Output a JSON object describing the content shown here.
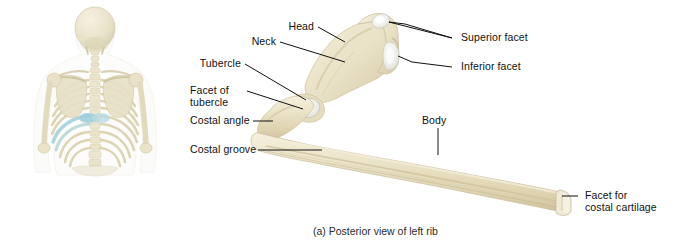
{
  "figure": {
    "caption": "(a) Posterior view of left rib",
    "orientation_panel": {
      "name": "posterior-torso-skeleton",
      "description": "Posterior view of upper torso skeleton with left rib highlighted",
      "highlight_color": "#a9d6e0",
      "bone_color": "#efe9d6"
    },
    "specimen": {
      "name": "left-rib",
      "bone_color": "#ece3c8",
      "bone_shadow": "#d9ccaa",
      "cartilage_color": "#f2f2ee"
    }
  },
  "labels": [
    {
      "id": "head",
      "text": "Head",
      "side": "left"
    },
    {
      "id": "neck",
      "text": "Neck",
      "side": "left"
    },
    {
      "id": "tubercle",
      "text": "Tubercle",
      "side": "left"
    },
    {
      "id": "facet-of-tubercle",
      "text": "Facet of",
      "text2": "tubercle",
      "side": "left"
    },
    {
      "id": "costal-angle",
      "text": "Costal angle",
      "side": "left"
    },
    {
      "id": "costal-groove",
      "text": "Costal groove",
      "side": "left"
    },
    {
      "id": "superior-facet",
      "text": "Superior facet",
      "side": "right"
    },
    {
      "id": "inferior-facet",
      "text": "Inferior facet",
      "side": "right"
    },
    {
      "id": "body",
      "text": "Body",
      "side": "top"
    },
    {
      "id": "facet-for-costal-cartilage",
      "text": "Facet for",
      "text2": "costal cartilage",
      "side": "right"
    }
  ],
  "text": {
    "head": "Head",
    "neck": "Neck",
    "tubercle": "Tubercle",
    "facet_of": "Facet of",
    "tubercle2": "tubercle",
    "costal_angle": "Costal angle",
    "costal_groove": "Costal groove",
    "superior_facet": "Superior facet",
    "inferior_facet": "Inferior facet",
    "body": "Body",
    "facet_for": "Facet for",
    "costal_cartilage": "costal cartilage",
    "caption": "(a) Posterior view of left rib"
  },
  "colors": {
    "background": "#ffffff",
    "leader_line": "#111111",
    "text": "#111111",
    "bone_light": "#f3edd9",
    "bone_mid": "#e6dcbc",
    "bone_dark": "#d2c49e",
    "facet_white": "#f4f4f0",
    "skeleton_bone": "#ece6d2",
    "skeleton_highlight": "#a9d6e0",
    "skeleton_outline": "#d8d2bd"
  }
}
